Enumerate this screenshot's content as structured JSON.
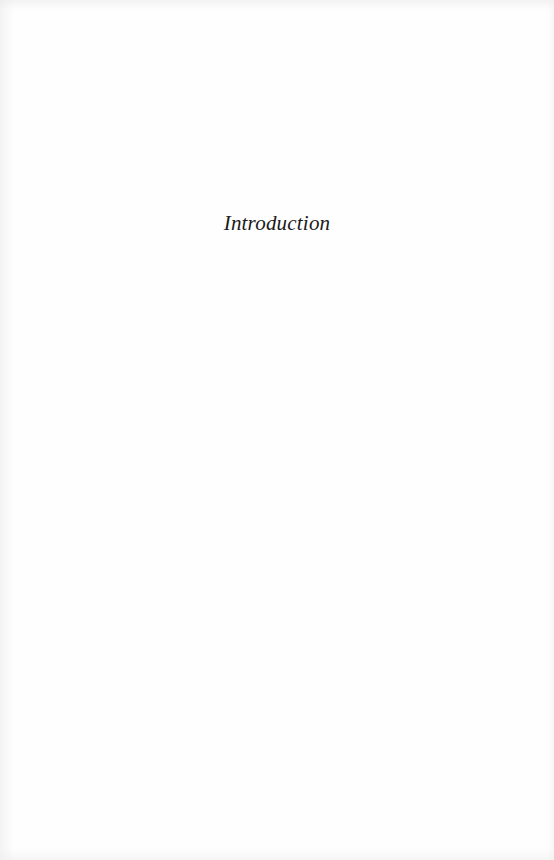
{
  "page": {
    "heading": "Introduction"
  }
}
